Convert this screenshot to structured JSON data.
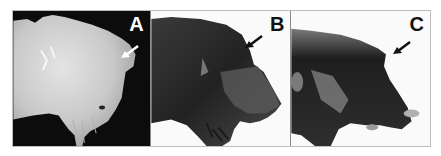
{
  "figure": {
    "panels": [
      {
        "id": "A",
        "label": "A",
        "background": "#0c0c0c",
        "specimen_tone": "pale",
        "arrow_direction": "down-left",
        "arrow_color": "#ffffff"
      },
      {
        "id": "B",
        "label": "B",
        "background": "#fafafa",
        "specimen_tone": "dark",
        "arrow_direction": "down-left",
        "arrow_color": "#111111"
      },
      {
        "id": "C",
        "label": "C",
        "background": "#fafafa",
        "specimen_tone": "dark",
        "arrow_direction": "down-left",
        "arrow_color": "#111111"
      }
    ]
  }
}
